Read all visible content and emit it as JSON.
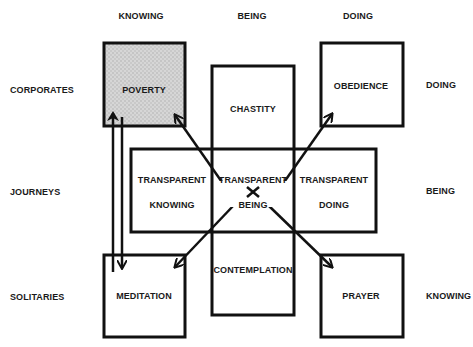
{
  "diagram": {
    "column_headers": [
      "KNOWING",
      "BEING",
      "DOING"
    ],
    "row_labels_left": [
      "CORPORATES",
      "JOURNEYS",
      "SOLITARIES"
    ],
    "row_labels_right": [
      "DOING",
      "BEING",
      "KNOWING"
    ],
    "boxes": {
      "poverty": "POVERTY",
      "obedience": "OBEDIENCE",
      "chastity": "CHASTITY",
      "contemplation": "CONTEMPLATION",
      "meditation": "MEDITATION",
      "prayer": "PRAYER",
      "transparent_knowing": [
        "TRANSPARENT",
        "KNOWING"
      ],
      "transparent_being": [
        "TRANSPARENT",
        "BEING"
      ],
      "transparent_doing": [
        "TRANSPARENT",
        "DOING"
      ]
    },
    "colors": {
      "line": "#111111",
      "shaded_fill": "#cfcfcf",
      "background": "#ffffff"
    }
  }
}
